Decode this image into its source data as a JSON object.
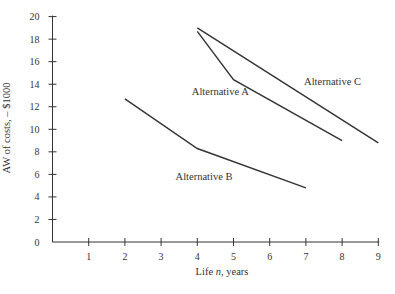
{
  "chart_data": {
    "type": "line",
    "title": "",
    "xlabel": "Life n, years",
    "xlabel_parts": {
      "pre": "Life ",
      "italic": "n",
      "post": ", years"
    },
    "ylabel": "AW of costs, – $1000",
    "xlim": [
      0,
      9
    ],
    "ylim": [
      0,
      20
    ],
    "x_ticks": [
      1,
      2,
      3,
      4,
      5,
      6,
      7,
      8,
      9
    ],
    "y_ticks": [
      0,
      2,
      4,
      6,
      8,
      10,
      12,
      14,
      16,
      18,
      20
    ],
    "grid": false,
    "legend": "inline labels",
    "series": [
      {
        "name": "Alternative A",
        "x": [
          4,
          5,
          8
        ],
        "y": [
          18.7,
          14.4,
          9.0
        ],
        "label_pos": [
          3.85,
          13.0
        ]
      },
      {
        "name": "Alternative B",
        "x": [
          2,
          4,
          7
        ],
        "y": [
          12.7,
          8.3,
          4.8
        ],
        "label_pos": [
          3.4,
          5.5
        ]
      },
      {
        "name": "Alternative C",
        "x": [
          4,
          9
        ],
        "y": [
          19.0,
          8.8
        ],
        "label_pos": [
          6.95,
          13.9
        ]
      }
    ],
    "line_color": "#333333"
  }
}
